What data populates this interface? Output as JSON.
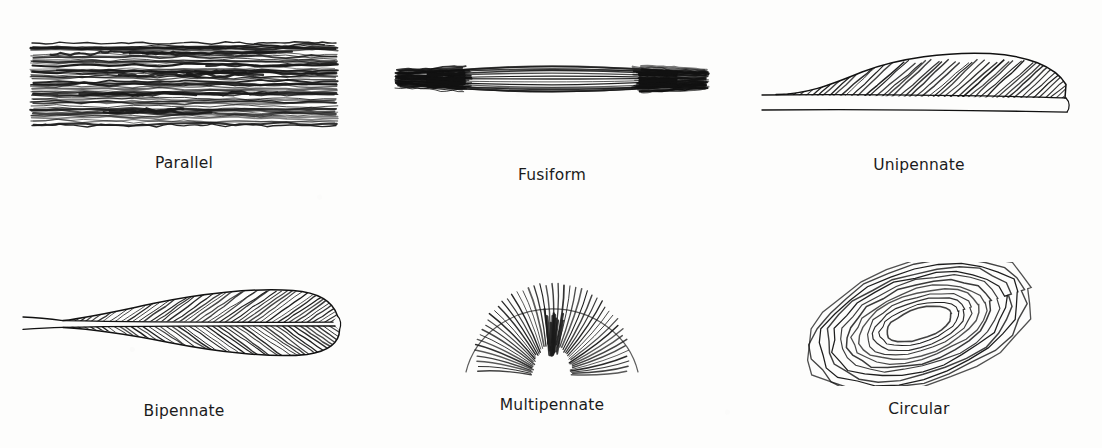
{
  "figure": {
    "background_color": "#fdfdfc",
    "ink_color": "#1b1b1b",
    "columns": 3,
    "rows": 2
  },
  "panels": [
    {
      "id": "parallel",
      "label": "Parallel",
      "row": 1,
      "column": 1,
      "description": "Long straight fibers running lengthwise along the muscle belly",
      "fiber_count": 26,
      "fiber_orientation_deg": 0
    },
    {
      "id": "fusiform",
      "label": "Fusiform",
      "row": 1,
      "column": 2,
      "description": "Spindle-shaped belly tapering to tendons at both ends",
      "fiber_count": 17,
      "fiber_orientation_deg": 0
    },
    {
      "id": "unipennate",
      "label": "Unipennate",
      "row": 1,
      "column": 3,
      "description": "Oblique fibers attaching to one side of a central tendon",
      "fiber_count": 42,
      "fiber_orientation_deg": 42
    },
    {
      "id": "bipennate",
      "label": "Bipennate",
      "row": 2,
      "column": 1,
      "description": "Oblique fibers attaching to both sides of a central tendon",
      "fiber_count": 76,
      "fiber_orientation_deg": 35
    },
    {
      "id": "multipennate",
      "label": "Multipennate",
      "row": 2,
      "column": 2,
      "description": "Fan of fiber bundles radiating from several tendons",
      "fiber_count": 46,
      "fiber_orientation_deg": 90
    },
    {
      "id": "circular",
      "label": "Circular",
      "row": 2,
      "column": 3,
      "description": "Concentric rings of fibers surrounding an opening",
      "fiber_count": 13,
      "fiber_orientation_deg": 18
    }
  ]
}
